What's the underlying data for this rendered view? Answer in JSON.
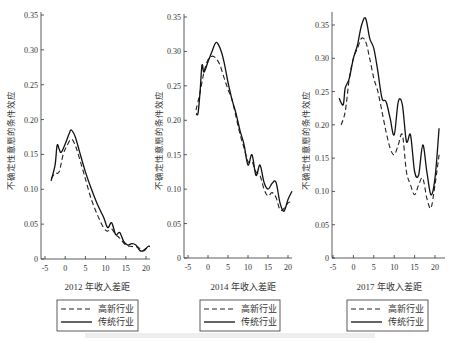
{
  "chart_data": [
    {
      "type": "line",
      "title": "",
      "xlabel": "2012 年收入差距",
      "ylabel": "不确定性意愿的条件效应",
      "xticks": [
        -5,
        0,
        5,
        10,
        15,
        20
      ],
      "yticks": [
        0,
        0.05,
        0.1,
        0.15,
        0.2,
        0.25,
        0.3,
        0.35
      ],
      "ylim": [
        0,
        0.35
      ],
      "xlim": [
        -5,
        21
      ],
      "legend": [
        "高新行业",
        "传统行业"
      ],
      "series": [
        {
          "name": "高新行业",
          "style": "dashed",
          "x": [
            -3.5,
            -2.5,
            -1.5,
            -0.5,
            0.5,
            1.5,
            2.5,
            3.5,
            5,
            6.5,
            8,
            9.5,
            10.5,
            11.5,
            12.5,
            13.5,
            15,
            16.5,
            18,
            19,
            20,
            21
          ],
          "y": [
            0.115,
            0.123,
            0.125,
            0.15,
            0.163,
            0.172,
            0.163,
            0.145,
            0.115,
            0.085,
            0.063,
            0.045,
            0.04,
            0.043,
            0.035,
            0.03,
            0.02,
            0.018,
            0.017,
            0.012,
            0.015,
            0.018
          ]
        },
        {
          "name": "传统行业",
          "style": "solid",
          "x": [
            -3.5,
            -2.5,
            -2,
            -1.5,
            -1,
            0,
            1,
            1.5,
            2.5,
            3.5,
            5,
            6.5,
            8,
            9.5,
            10.5,
            11.5,
            12.5,
            13.5,
            14.5,
            15.5,
            16.5,
            17.5,
            18.5,
            19.5,
            20.5,
            21
          ],
          "y": [
            0.112,
            0.135,
            0.163,
            0.158,
            0.153,
            0.165,
            0.18,
            0.185,
            0.175,
            0.155,
            0.125,
            0.1,
            0.078,
            0.06,
            0.045,
            0.052,
            0.035,
            0.038,
            0.025,
            0.02,
            0.022,
            0.02,
            0.012,
            0.012,
            0.018,
            0.018
          ]
        }
      ]
    },
    {
      "type": "line",
      "title": "",
      "xlabel": "2014 年收入差距",
      "ylabel": "不确定性意愿的条件效应",
      "xticks": [
        -5,
        0,
        5,
        10,
        15,
        20
      ],
      "yticks": [
        0,
        0.05,
        0.1,
        0.15,
        0.2,
        0.25,
        0.3,
        0.35
      ],
      "ylim": [
        0,
        0.35
      ],
      "xlim": [
        -5,
        21
      ],
      "legend": [
        "高新行业",
        "传统行业"
      ],
      "series": [
        {
          "name": "高新行业",
          "style": "dashed",
          "x": [
            -3,
            -2,
            -1,
            0,
            1,
            2,
            3,
            4,
            5,
            6,
            7,
            8,
            9,
            10,
            11,
            12,
            13,
            14,
            15,
            16,
            17,
            18,
            19,
            20,
            21
          ],
          "y": [
            0.215,
            0.24,
            0.27,
            0.288,
            0.293,
            0.29,
            0.28,
            0.262,
            0.245,
            0.23,
            0.205,
            0.18,
            0.16,
            0.14,
            0.14,
            0.125,
            0.12,
            0.1,
            0.09,
            0.095,
            0.088,
            0.07,
            0.072,
            0.08,
            0.082
          ]
        },
        {
          "name": "传统行业",
          "style": "solid",
          "x": [
            -3,
            -2.5,
            -2,
            -1.5,
            -1,
            0,
            1,
            2,
            3,
            4,
            5,
            6,
            7,
            8,
            9,
            10,
            11,
            12,
            13,
            14,
            15,
            16,
            17,
            18,
            19,
            20,
            21
          ],
          "y": [
            0.21,
            0.21,
            0.24,
            0.28,
            0.27,
            0.285,
            0.3,
            0.313,
            0.305,
            0.285,
            0.255,
            0.23,
            0.21,
            0.185,
            0.165,
            0.135,
            0.15,
            0.12,
            0.135,
            0.11,
            0.1,
            0.108,
            0.11,
            0.08,
            0.068,
            0.085,
            0.097
          ]
        }
      ]
    },
    {
      "type": "line",
      "title": "",
      "xlabel": "2017 年收入差距",
      "ylabel": "不确定性意愿的条件效应",
      "xticks": [
        -5,
        0,
        5,
        10,
        15,
        20
      ],
      "yticks": [
        0,
        0.05,
        0.1,
        0.15,
        0.2,
        0.25,
        0.3,
        0.35
      ],
      "ylim": [
        0,
        0.37
      ],
      "xlim": [
        -5,
        22
      ],
      "legend": [
        "高新行业",
        "传统行业"
      ],
      "series": [
        {
          "name": "高新行业",
          "style": "dashed",
          "x": [
            -3,
            -2,
            -1,
            0,
            1,
            2,
            3,
            4,
            5,
            6,
            7,
            8,
            9,
            10,
            11,
            12,
            13,
            14,
            15,
            16,
            17,
            18,
            19,
            20,
            21
          ],
          "y": [
            0.2,
            0.22,
            0.27,
            0.3,
            0.315,
            0.33,
            0.325,
            0.3,
            0.27,
            0.25,
            0.22,
            0.19,
            0.165,
            0.155,
            0.17,
            0.185,
            0.13,
            0.11,
            0.095,
            0.11,
            0.12,
            0.09,
            0.075,
            0.11,
            0.155
          ]
        },
        {
          "name": "传统行业",
          "style": "solid",
          "x": [
            -3.5,
            -2.5,
            -2,
            -1,
            0,
            1,
            2,
            3,
            4,
            5,
            6,
            7,
            8,
            9,
            10,
            11,
            12,
            13,
            14,
            15,
            16,
            17,
            18,
            19,
            20,
            21
          ],
          "y": [
            0.24,
            0.23,
            0.255,
            0.27,
            0.3,
            0.32,
            0.35,
            0.36,
            0.33,
            0.315,
            0.28,
            0.24,
            0.235,
            0.21,
            0.185,
            0.235,
            0.23,
            0.175,
            0.185,
            0.13,
            0.125,
            0.17,
            0.13,
            0.095,
            0.12,
            0.195
          ]
        }
      ]
    }
  ],
  "panels": [
    {
      "xlabel": "2012 年收入差距",
      "ylabel": "不确定性意愿的条件效应",
      "legend_hi": "高新行业",
      "legend_trad": "传统行业"
    },
    {
      "xlabel": "2014 年收入差距",
      "ylabel": "不确定性意愿的条件效应",
      "legend_hi": "高新行业",
      "legend_trad": "传统行业"
    },
    {
      "xlabel": "2017 年收入差距",
      "ylabel": "不确定性意愿的条件效应",
      "legend_hi": "高新行业",
      "legend_trad": "传统行业"
    }
  ]
}
